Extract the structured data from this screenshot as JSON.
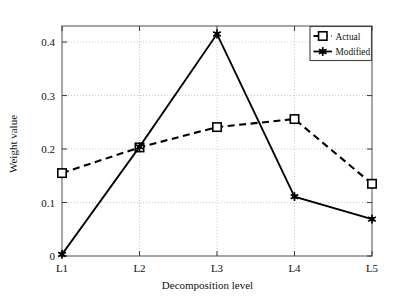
{
  "chart_data": {
    "type": "line",
    "title": "",
    "xlabel": "Decomposition level",
    "ylabel": "Weight value",
    "categories": [
      "L1",
      "L2",
      "L3",
      "L4",
      "L5"
    ],
    "xtick_labels": [
      "L1",
      "L2",
      "L3",
      "L4",
      "L5"
    ],
    "ytick_labels": [
      "0",
      "0.1",
      "0.2",
      "0.3",
      "0.4"
    ],
    "ytick_values": [
      0,
      0.1,
      0.2,
      0.3,
      0.4
    ],
    "ylim": [
      0,
      0.43
    ],
    "xlim": [
      0,
      4
    ],
    "grid": true,
    "grid_style": "dotted",
    "grid_color": "#c8c8c8",
    "legend_position": "top-right",
    "series": [
      {
        "name": "Actual",
        "values": [
          0.155,
          0.203,
          0.241,
          0.256,
          0.135
        ],
        "line_style": "dashed",
        "marker": "square-open",
        "color": "#000000"
      },
      {
        "name": "Modified",
        "values": [
          0.003,
          0.204,
          0.415,
          0.111,
          0.069
        ],
        "line_style": "solid",
        "marker": "star-filled",
        "color": "#000000"
      }
    ]
  },
  "legend": {
    "entries": [
      {
        "label": "Actual"
      },
      {
        "label": "Modified"
      }
    ]
  },
  "axes": {
    "x_title": "Decomposition level",
    "y_title": "Weight value"
  }
}
